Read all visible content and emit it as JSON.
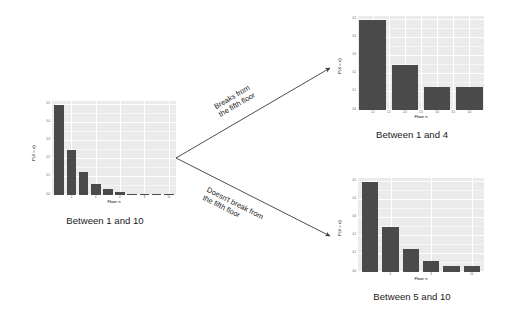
{
  "figure": {
    "bar_color": "#4a4a4a",
    "panel_color": "#ebebeb",
    "grid_color": "#ffffff",
    "arrow_color": "#3a3a3a"
  },
  "branch": {
    "upper_label": "Breaks from\nthe fifth floor",
    "lower_label": "Doesn't break from\nthe fifth floor"
  },
  "captions": {
    "left": "Between 1 and 10",
    "top_right": "Between 1 and 4",
    "bottom_right": "Between 5 and 10"
  },
  "chart_data": [
    {
      "id": "left",
      "type": "bar",
      "title": "Between 1 and 10",
      "xlabel": "Floor n",
      "ylabel": "P(X = n)",
      "categories": [
        "1",
        "2",
        "3",
        "4",
        "5",
        "6",
        "7",
        "8",
        "9",
        "10"
      ],
      "x": [
        1,
        2,
        3,
        4,
        5,
        6,
        7,
        8,
        9,
        10
      ],
      "values": [
        0.5,
        0.25,
        0.125,
        0.0625,
        0.031,
        0.016,
        0.008,
        0.004,
        0.002,
        0.001
      ],
      "xticks": [
        "2",
        "4",
        "6",
        "8",
        "10"
      ],
      "xtick_values": [
        2,
        4,
        6,
        8,
        10
      ],
      "yticks": [
        "0.0",
        "0.1",
        "0.2",
        "0.3",
        "0.4",
        "0.5"
      ],
      "ytick_values": [
        0.0,
        0.1,
        0.2,
        0.3,
        0.4,
        0.5
      ],
      "xlim": [
        0.4,
        10.6
      ],
      "ylim": [
        0,
        0.52
      ],
      "grid": true,
      "legend": "none"
    },
    {
      "id": "top_right",
      "type": "bar",
      "title": "Between 1 and 4",
      "xlabel": "Floor n",
      "ylabel": "P(X = n)",
      "categories": [
        "1",
        "2",
        "3",
        "4"
      ],
      "x": [
        1,
        2,
        3,
        4
      ],
      "values": [
        0.5,
        0.25,
        0.125,
        0.125
      ],
      "xticks": [
        "1.0",
        "1.5",
        "2.0",
        "2.5",
        "3.0",
        "3.5",
        "4.0"
      ],
      "xtick_values": [
        1.0,
        1.5,
        2.0,
        2.5,
        3.0,
        3.5,
        4.0
      ],
      "yticks": [
        "0.0",
        "0.1",
        "0.2",
        "0.3",
        "0.4",
        "0.5"
      ],
      "ytick_values": [
        0.0,
        0.1,
        0.2,
        0.3,
        0.4,
        0.5
      ],
      "xlim": [
        0.55,
        4.45
      ],
      "ylim": [
        0,
        0.52
      ],
      "grid": true,
      "legend": "none"
    },
    {
      "id": "bottom_right",
      "type": "bar",
      "title": "Between 5 and 10",
      "xlabel": "Floor n",
      "ylabel": "P(X = n)",
      "categories": [
        "5",
        "6",
        "7",
        "8",
        "9",
        "10"
      ],
      "x": [
        5,
        6,
        7,
        8,
        9,
        10
      ],
      "values": [
        0.5,
        0.25,
        0.125,
        0.0625,
        0.031,
        0.031
      ],
      "xticks": [
        "6",
        "8",
        "10"
      ],
      "xtick_values": [
        6,
        8,
        10
      ],
      "yticks": [
        "0.0",
        "0.1",
        "0.2",
        "0.3",
        "0.4",
        "0.5"
      ],
      "ytick_values": [
        0.0,
        0.1,
        0.2,
        0.3,
        0.4,
        0.5
      ],
      "xlim": [
        4.4,
        10.6
      ],
      "ylim": [
        0,
        0.52
      ],
      "grid": true,
      "legend": "none"
    }
  ]
}
